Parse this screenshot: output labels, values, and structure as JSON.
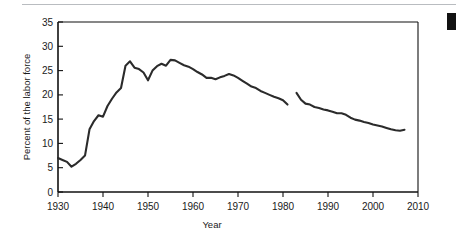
{
  "figure": {
    "name": "union-membership-line-chart",
    "page_marker_color": "#121212",
    "top_rule_color": "#b9bcc0",
    "line_color": "#2b2b2b",
    "axis_color": "#111111"
  },
  "chart_data": {
    "type": "line",
    "title": "",
    "xlabel": "Year",
    "ylabel": "Percent of the labor force",
    "xlim": [
      1930,
      2010
    ],
    "ylim": [
      0,
      35
    ],
    "grid": false,
    "legend": "none",
    "xticks": [
      1930,
      1940,
      1950,
      1960,
      1970,
      1980,
      1990,
      2000,
      2010
    ],
    "xtick_labels": [
      "1930",
      "1940",
      "1950",
      "1960",
      "1970",
      "1980",
      "1990",
      "2000",
      "2010"
    ],
    "yticks": [
      0,
      5,
      10,
      15,
      20,
      25,
      30,
      35
    ],
    "ytick_labels": [
      "0",
      "5",
      "10",
      "15",
      "20",
      "25",
      "30",
      "35"
    ],
    "series": [
      {
        "name": "1930-1981",
        "x": [
          1930,
          1931,
          1932,
          1933,
          1934,
          1935,
          1936,
          1937,
          1938,
          1939,
          1940,
          1941,
          1942,
          1943,
          1944,
          1945,
          1946,
          1947,
          1948,
          1949,
          1950,
          1951,
          1952,
          1953,
          1954,
          1955,
          1956,
          1957,
          1958,
          1959,
          1960,
          1961,
          1962,
          1963,
          1964,
          1965,
          1966,
          1967,
          1968,
          1969,
          1970,
          1971,
          1972,
          1973,
          1974,
          1975,
          1976,
          1977,
          1978,
          1979,
          1980,
          1981
        ],
        "y": [
          7.0,
          6.6,
          6.2,
          5.2,
          5.8,
          6.6,
          7.5,
          12.9,
          14.6,
          15.8,
          15.5,
          17.7,
          19.2,
          20.5,
          21.4,
          26.0,
          26.9,
          25.6,
          25.3,
          24.6,
          23.0,
          25.0,
          25.9,
          26.4,
          26.0,
          27.2,
          27.1,
          26.6,
          26.1,
          25.8,
          25.3,
          24.7,
          24.2,
          23.5,
          23.5,
          23.2,
          23.6,
          23.9,
          24.3,
          24.0,
          23.5,
          22.9,
          22.3,
          21.7,
          21.4,
          20.8,
          20.4,
          20.0,
          19.6,
          19.3,
          18.9,
          18.0
        ],
        "style": "solid"
      },
      {
        "name": "1983-2007",
        "x": [
          1983,
          1984,
          1985,
          1986,
          1987,
          1988,
          1989,
          1990,
          1991,
          1992,
          1993,
          1994,
          1995,
          1996,
          1997,
          1998,
          1999,
          2000,
          2001,
          2002,
          2003,
          2004,
          2005,
          2006,
          2007
        ],
        "y": [
          20.4,
          19.0,
          18.2,
          18.0,
          17.5,
          17.3,
          17.0,
          16.8,
          16.5,
          16.2,
          16.2,
          15.9,
          15.3,
          14.9,
          14.7,
          14.4,
          14.2,
          13.9,
          13.7,
          13.5,
          13.2,
          12.9,
          12.7,
          12.6,
          12.8
        ],
        "style": "solid"
      }
    ]
  }
}
